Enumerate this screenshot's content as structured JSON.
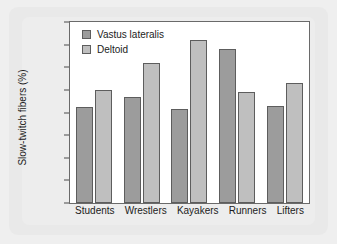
{
  "chart_data": {
    "type": "bar",
    "title": "",
    "xlabel": "",
    "ylabel": "Slow-twitch fibers (%)",
    "ylim": [
      0,
      80
    ],
    "ytick_step": 10,
    "yticks": [
      0,
      10,
      20,
      30,
      40,
      50,
      60,
      70,
      80
    ],
    "ytick_labels": [
      "0",
      "10",
      "20",
      "30",
      "40",
      "50",
      "60",
      "70",
      "80"
    ],
    "grid": false,
    "legend_position": "top-left",
    "categories": [
      "Students",
      "Wrestlers",
      "Kayakers",
      "Runners",
      "Lifters"
    ],
    "series": [
      {
        "name": "Vastus lateralis",
        "color": "#9c9c9c",
        "values": [
          42.5,
          47,
          41.5,
          68,
          43
        ]
      },
      {
        "name": "Deltoid",
        "color": "#bfbfbf",
        "values": [
          50,
          62,
          72,
          49,
          53
        ]
      }
    ]
  },
  "colors": {
    "page_background": "#efefef",
    "card_background": "#e9e9e9",
    "plot_background": "#ffffff",
    "axis_line": "#6a6a6a",
    "bar_outline": "#5d5d5d",
    "text": "#1c1c1c"
  }
}
